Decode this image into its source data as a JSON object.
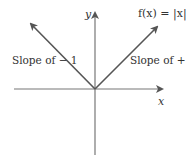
{
  "diagram": {
    "function_label": "f(x) = |x|",
    "axes": {
      "x_label": "x",
      "y_label": "y"
    },
    "annotations": {
      "left_branch": "Slope of − 1",
      "right_branch": "Slope of + 1"
    },
    "colors": {
      "line": "#555555",
      "text": "#333333",
      "background": "#ffffff"
    }
  }
}
